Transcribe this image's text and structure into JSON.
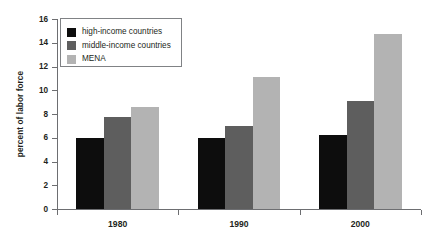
{
  "chart_data": {
    "type": "bar",
    "title": "",
    "subtitle": "",
    "xlabel": "",
    "ylabel": "percent of labor force",
    "categories": [
      "1980",
      "1990",
      "2000"
    ],
    "series": [
      {
        "name": "high-income countries",
        "color": "#0d0d0d",
        "values": [
          6.0,
          6.0,
          6.2
        ]
      },
      {
        "name": "middle-income countries",
        "color": "#5e5e5e",
        "values": [
          7.75,
          7.0,
          9.1
        ]
      },
      {
        "name": "MENA",
        "color": "#b3b3b3",
        "values": [
          8.6,
          11.1,
          14.7
        ]
      }
    ],
    "ylim": [
      0,
      16
    ],
    "ytick_step": 2,
    "yticks": [
      "0",
      "2",
      "4",
      "6",
      "8",
      "10",
      "12",
      "14",
      "16"
    ],
    "grid": false,
    "legend_position": "top-left"
  },
  "legend": {
    "entries": [
      {
        "label": "high-income countries",
        "color": "#0d0d0d"
      },
      {
        "label": "middle-income countries",
        "color": "#5e5e5e"
      },
      {
        "label": "MENA",
        "color": "#b3b3b3"
      }
    ]
  },
  "axis_colors": {
    "line": "#6d6e71",
    "text": "#231f20"
  }
}
